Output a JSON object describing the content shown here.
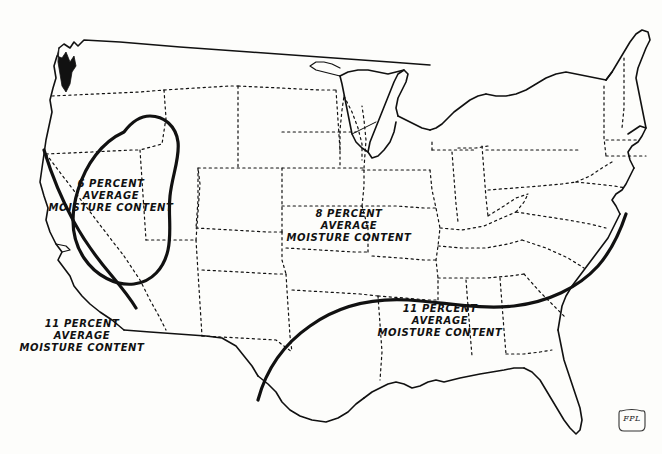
{
  "figure": {
    "kind": "thematic-map",
    "region": "continental-united-states",
    "background_color": "#fdfdfb",
    "ink_color": "#111111"
  },
  "map": {
    "coastline_name": "us-outline",
    "state_border_style": "dotted",
    "contour_name": "moisture-content-contour",
    "zones": [
      {
        "id": "west",
        "value": "6",
        "line1": "6 PERCENT",
        "line2": "AVERAGE",
        "line3": "MOISTURE CONTENT"
      },
      {
        "id": "central",
        "value": "8",
        "line1": "8 PERCENT",
        "line2": "AVERAGE",
        "line3": "MOISTURE CONTENT"
      },
      {
        "id": "southwest",
        "value": "11",
        "line1": "11 PERCENT",
        "line2": "AVERAGE",
        "line3": "MOISTURE CONTENT"
      },
      {
        "id": "southeast",
        "value": "11",
        "line1": "11 PERCENT",
        "line2": "AVERAGE",
        "line3": "MOISTURE CONTENT"
      }
    ]
  },
  "badge": {
    "text": "FPL",
    "shape": "shield"
  }
}
